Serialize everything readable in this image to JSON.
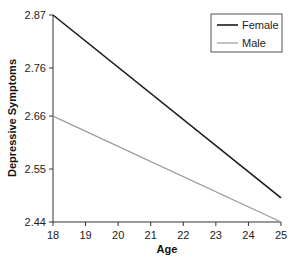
{
  "chart_data": {
    "type": "line",
    "title": "",
    "xlabel": "Age",
    "ylabel": "Depressive Symptoms",
    "x": [
      18,
      25
    ],
    "x_ticks": [
      "18",
      "19",
      "20",
      "21",
      "22",
      "23",
      "24",
      "25"
    ],
    "y_ticks": [
      "2.44",
      "2.55",
      "2.66",
      "2.76",
      "2.87"
    ],
    "xlim": [
      18,
      25
    ],
    "ylim": [
      2.44,
      2.87
    ],
    "grid": false,
    "legend_position": "upper right",
    "series": [
      {
        "name": "Female",
        "color": "#1a1a1a",
        "values": [
          2.87,
          2.49
        ]
      },
      {
        "name": "Male",
        "color": "#9a9a9a",
        "values": [
          2.66,
          2.44
        ]
      }
    ]
  },
  "legend": {
    "items": [
      {
        "label": "Female",
        "color": "#1a1a1a"
      },
      {
        "label": "Male",
        "color": "#9a9a9a"
      }
    ]
  }
}
